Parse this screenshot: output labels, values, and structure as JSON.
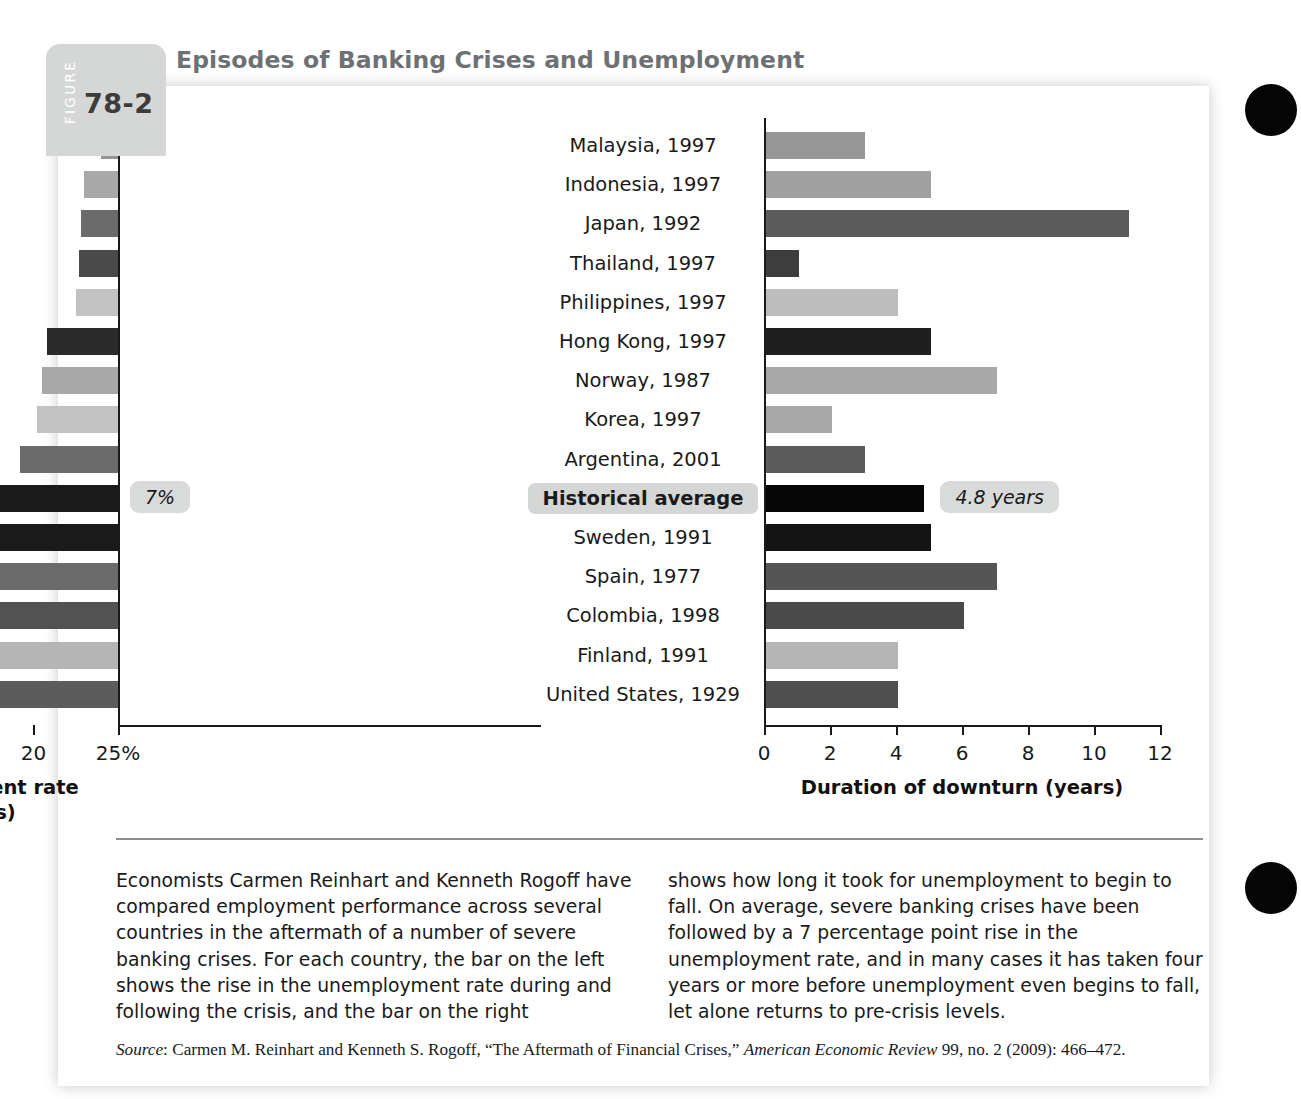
{
  "figure": {
    "tab_word": "FIGURE",
    "number": "78-2",
    "title": "Episodes of Banking Crises and Unemployment"
  },
  "chart_data": {
    "type": "bar",
    "title": "Episodes of Banking Crises and Unemployment",
    "orientation": "horizontal",
    "grid": false,
    "legend": "none",
    "categories": [
      "Malaysia, 1997",
      "Indonesia, 1997",
      "Japan, 1992",
      "Thailand, 1997",
      "Philippines, 1997",
      "Hong Kong, 1997",
      "Norway, 1987",
      "Korea, 1997",
      "Argentina, 2001",
      "Historical average",
      "Sweden, 1991",
      "Spain, 1977",
      "Colombia, 1998",
      "Finland, 1991",
      "United States, 1929"
    ],
    "panels": [
      {
        "id": "unemployment",
        "side": "left",
        "xlabel": "Increase in unemployment rate (percentage points)",
        "xlabel_line1": "Increase in unemployment rate",
        "xlabel_line2": "(percentage points)",
        "xlim": [
          0,
          25
        ],
        "ticks": [
          0,
          5,
          10,
          15,
          20,
          25
        ],
        "tick_labels": [
          "0",
          "5",
          "10",
          "15",
          "20",
          "25%"
        ],
        "unit": "percentage points",
        "values": [
          1.0,
          2.0,
          2.2,
          2.3,
          2.5,
          4.2,
          4.5,
          4.8,
          5.8,
          7.0,
          7.7,
          11.5,
          12.8,
          13.5,
          22.0
        ],
        "colors": [
          "#969696",
          "#a8a8a8",
          "#6b6b6b",
          "#4a4a4a",
          "#c2c2c2",
          "#2b2b2b",
          "#a8a8a8",
          "#c2c2c2",
          "#6b6b6b",
          "#1a1a1a",
          "#1a1a1a",
          "#6b6b6b",
          "#525252",
          "#b5b5b5",
          "#5c5c5c"
        ],
        "annotation": {
          "label": "7%",
          "category": "Historical average",
          "value": 7.0
        }
      },
      {
        "id": "duration",
        "side": "right",
        "xlabel": "Duration of downturn (years)",
        "xlabel_line1": "Duration of downturn (years)",
        "xlabel_line2": "",
        "xlim": [
          0,
          12
        ],
        "ticks": [
          0,
          2,
          4,
          6,
          8,
          10,
          12
        ],
        "tick_labels": [
          "0",
          "2",
          "4",
          "6",
          "8",
          "10",
          "12"
        ],
        "unit": "years",
        "values": [
          3,
          5,
          11,
          1,
          4,
          5,
          7,
          2,
          3,
          4.8,
          5,
          7,
          6,
          4,
          4
        ],
        "colors": [
          "#969696",
          "#a0a0a0",
          "#5c5c5c",
          "#3d3d3d",
          "#bdbdbd",
          "#1f1f1f",
          "#a8a8a8",
          "#a8a8a8",
          "#5c5c5c",
          "#060606",
          "#141414",
          "#555555",
          "#4a4a4a",
          "#b5b5b5",
          "#4f4f4f"
        ],
        "annotation": {
          "label": "4.8 years",
          "category": "Historical average",
          "value": 4.8
        }
      }
    ]
  },
  "body": {
    "left_paragraph": "Economists Carmen Reinhart and Kenneth Rogoff have compared employment performance across several countries in the aftermath of a number of severe banking crises. For each country, the bar on the left shows the rise in the unemployment rate during and following the crisis, and the bar on the right",
    "right_paragraph": "shows how long it took for unemployment to begin to fall. On average, severe banking crises have been followed by a 7 percentage point rise in the unemployment rate, and in many cases it has taken four years or more before unemployment even begins to fall, let alone returns to pre-crisis levels."
  },
  "source": {
    "label": "Source",
    "text": ": Carmen M. Reinhart and Kenneth S. Rogoff, “The Aftermath of Financial Crises,” ",
    "journal": "American Economic Review",
    "citation": " 99, no. 2 (2009): 466–472."
  },
  "colors": {
    "tab_gray": "#d5d7d7",
    "title_gray": "#6e7173",
    "highlight_gray": "#d5d7d7",
    "axis_black": "#1a1a1a",
    "divider_gray": "#8b8d8e"
  }
}
